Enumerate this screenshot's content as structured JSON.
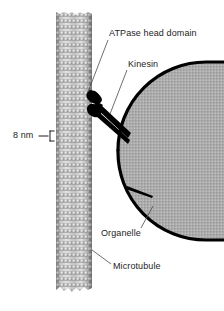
{
  "figure": {
    "background_color": "#ffffff"
  },
  "labels": {
    "atpase": "ATPase head domain",
    "kinesin": "Kinesin",
    "organelle": "Organelle",
    "microtubule": "Microtubule",
    "scale": "8 nm"
  },
  "structures": {
    "microtubule": {
      "name": "microtubule",
      "description": "beaded protofilament cylinder",
      "color_light": "#e8e8e8",
      "color_mid": "#b6b6b6",
      "color_dark": "#8a8a8a",
      "outline_color": "#6e6e6e",
      "bead_rows": 47,
      "bead_columns": 9,
      "bounds": {
        "x": 56,
        "y": 12,
        "width": 36,
        "height": 280
      }
    },
    "organelle": {
      "name": "organelle",
      "description": "membrane-bound vesicle with stippled lumen",
      "membrane_color": "#000000",
      "membrane_width_px": 3.2,
      "fill_color": "#a9a9a9",
      "stipple_color": "#8f8f8f",
      "bounds": {
        "x": 118,
        "y": 62,
        "width": 106,
        "height": 178
      }
    },
    "kinesin": {
      "name": "kinesin",
      "description": "two ATPase head domains joined to a stalk reaching the organelle",
      "color": "#000000",
      "heads": 2
    },
    "scale_bar": {
      "name": "scale-bar",
      "value": "8 nm",
      "color": "#1d1d1d",
      "span_px": 9
    }
  },
  "leaders": {
    "color": "#4a4a4a",
    "width_px": 0.8,
    "items": [
      {
        "name": "atpase-leader",
        "from": [
          108,
          40
        ],
        "to": [
          88,
          92
        ]
      },
      {
        "name": "kinesin-leader",
        "from": [
          127,
          70
        ],
        "to": [
          110,
          112
        ]
      },
      {
        "name": "organelle-leader",
        "from": [
          141,
          228
        ],
        "to": [
          152,
          208
        ]
      },
      {
        "name": "microtubule-leader",
        "from": [
          111,
          264
        ],
        "to": [
          92,
          250
        ]
      }
    ]
  }
}
